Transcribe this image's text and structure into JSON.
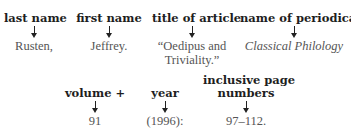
{
  "row1": [
    {
      "label": "last name",
      "value_lines": [
        "Rusten,"
      ],
      "italic": false
    },
    {
      "label": "first name",
      "value_lines": [
        "Jeffrey."
      ],
      "italic": false
    },
    {
      "label": "title of article",
      "value_lines": [
        "“Oedipus and",
        "Triviality.”"
      ],
      "italic": false
    },
    {
      "label": "name of periodical",
      "value_lines": [
        "Classical Philology"
      ],
      "italic": true
    }
  ],
  "row2": [
    {
      "label_lines": [
        "volume +"
      ],
      "value": "91"
    },
    {
      "label_lines": [
        "year"
      ],
      "value": "(1996):"
    },
    {
      "label_lines": [
        "inclusive page",
        "numbers"
      ],
      "value": "97–112."
    }
  ],
  "icons": {
    "arrow": "down-arrow-icon"
  }
}
